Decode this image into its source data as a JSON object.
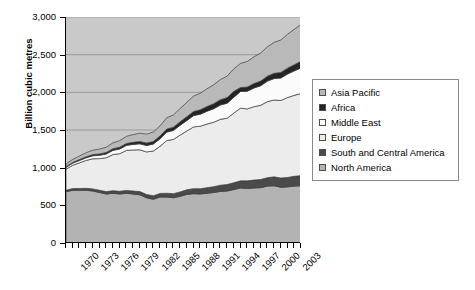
{
  "chart_data": {
    "type": "area",
    "stacked": true,
    "title": "",
    "xlabel": "",
    "ylabel": "Billion cubic metres",
    "ylim": [
      0,
      3000
    ],
    "yticks": [
      "0",
      "500",
      "1,000",
      "1,500",
      "2,000",
      "2,500",
      "3,000"
    ],
    "ytick_values": [
      0,
      500,
      1000,
      1500,
      2000,
      2500,
      3000
    ],
    "xlim": [
      1970,
      2005
    ],
    "xticks": [
      "1970",
      "1973",
      "1976",
      "1979",
      "1982",
      "1985",
      "1988",
      "1991",
      "1994",
      "1997",
      "2000",
      "2003"
    ],
    "xtick_values": [
      1970,
      1973,
      1976,
      1979,
      1982,
      1985,
      1988,
      1991,
      1994,
      1997,
      2000,
      2003
    ],
    "grid": "horizontal",
    "legend_position": "right",
    "x": [
      1970,
      1971,
      1972,
      1973,
      1974,
      1975,
      1976,
      1977,
      1978,
      1979,
      1980,
      1981,
      1982,
      1983,
      1984,
      1985,
      1986,
      1987,
      1988,
      1989,
      1990,
      1991,
      1992,
      1993,
      1994,
      1995,
      1996,
      1997,
      1998,
      1999,
      2000,
      2001,
      2002,
      2003,
      2004,
      2005
    ],
    "series": [
      {
        "name": "North America",
        "color": "#b3b3b3",
        "values": [
          680,
          700,
          700,
          700,
          690,
          670,
          650,
          660,
          650,
          660,
          650,
          640,
          600,
          580,
          610,
          610,
          600,
          620,
          645,
          655,
          650,
          660,
          670,
          685,
          690,
          710,
          730,
          725,
          730,
          735,
          755,
          760,
          740,
          745,
          755,
          760
        ]
      },
      {
        "name": "South and Central America",
        "color": "#4a4a4a",
        "values": [
          20,
          22,
          24,
          26,
          28,
          30,
          32,
          34,
          36,
          38,
          40,
          42,
          44,
          46,
          48,
          50,
          55,
          58,
          62,
          66,
          70,
          74,
          78,
          82,
          86,
          90,
          95,
          100,
          105,
          108,
          112,
          118,
          122,
          126,
          130,
          135
        ]
      },
      {
        "name": "Europe",
        "color": "#ececec",
        "values": [
          280,
          310,
          340,
          370,
          400,
          420,
          450,
          480,
          500,
          530,
          545,
          555,
          565,
          595,
          625,
          700,
          720,
          755,
          780,
          820,
          830,
          845,
          855,
          875,
          880,
          925,
          965,
          955,
          975,
          985,
          1010,
          1020,
          1030,
          1060,
          1075,
          1090
        ]
      },
      {
        "name": "Middle East",
        "color": "#fbfbfb",
        "values": [
          25,
          28,
          32,
          36,
          40,
          45,
          50,
          56,
          62,
          68,
          74,
          80,
          86,
          92,
          100,
          112,
          120,
          130,
          140,
          150,
          160,
          170,
          180,
          190,
          200,
          210,
          222,
          235,
          248,
          260,
          272,
          285,
          298,
          312,
          325,
          340
        ]
      },
      {
        "name": "Africa",
        "color": "#242424",
        "values": [
          8,
          10,
          12,
          14,
          16,
          18,
          20,
          22,
          24,
          26,
          28,
          30,
          32,
          34,
          36,
          40,
          43,
          46,
          50,
          54,
          58,
          62,
          66,
          70,
          74,
          78,
          52,
          55,
          58,
          62,
          66,
          70,
          74,
          78,
          82,
          86
        ]
      },
      {
        "name": "Asia Pacific",
        "color": "#b9b9b9",
        "values": [
          35,
          40,
          46,
          52,
          58,
          64,
          70,
          78,
          86,
          94,
          102,
          110,
          118,
          126,
          136,
          150,
          162,
          176,
          190,
          205,
          220,
          236,
          252,
          268,
          285,
          300,
          320,
          340,
          355,
          372,
          390,
          410,
          430,
          450,
          470,
          490
        ]
      }
    ],
    "legend_order_top_to_bottom": [
      "Asia Pacific",
      "Africa",
      "Middle East",
      "Europe",
      "South and Central America",
      "North America"
    ]
  },
  "legend": {
    "items": [
      {
        "label": "Asia Pacific",
        "color": "#b9b9b9"
      },
      {
        "label": "Africa",
        "color": "#242424"
      },
      {
        "label": "Middle East",
        "color": "#fbfbfb"
      },
      {
        "label": "Europe",
        "color": "#ececec"
      },
      {
        "label": "South and Central America",
        "color": "#4a4a4a"
      },
      {
        "label": "North America",
        "color": "#b3b3b3"
      }
    ]
  },
  "axes": {
    "y_title": "Billion cubic metres"
  }
}
